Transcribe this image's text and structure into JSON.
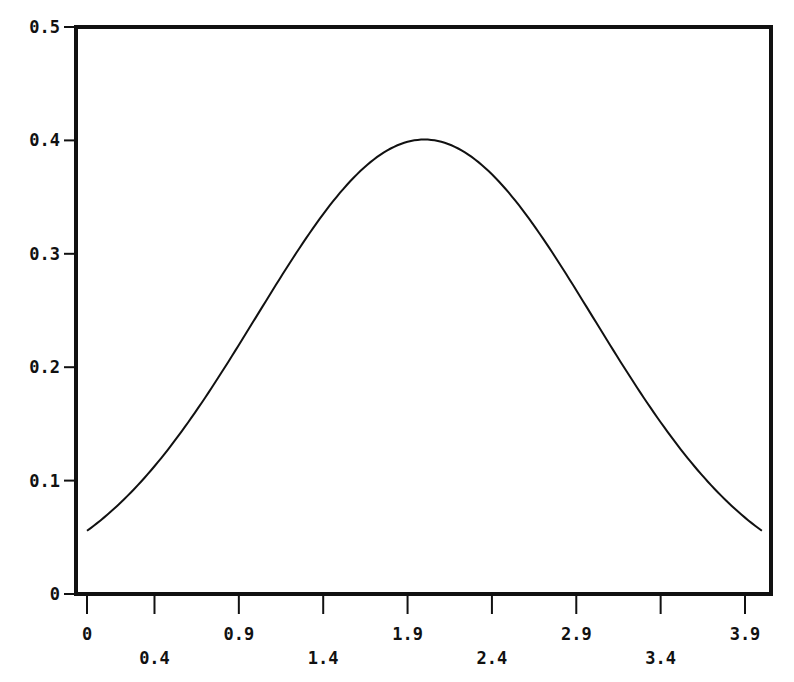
{
  "chart_data": {
    "type": "line",
    "title": "",
    "xlabel": "",
    "ylabel": "",
    "xlim": [
      -0.06,
      4.1
    ],
    "ylim": [
      0,
      0.5
    ],
    "grid": false,
    "legend": null,
    "x_ticks": [
      {
        "value": 0,
        "label": "0",
        "row": 0
      },
      {
        "value": 0.4,
        "label": "0.4",
        "row": 1
      },
      {
        "value": 0.9,
        "label": "0.9",
        "row": 0
      },
      {
        "value": 1.4,
        "label": "1.4",
        "row": 1
      },
      {
        "value": 1.9,
        "label": "1.9",
        "row": 0
      },
      {
        "value": 2.4,
        "label": "2.4",
        "row": 1
      },
      {
        "value": 2.9,
        "label": "2.9",
        "row": 0
      },
      {
        "value": 3.4,
        "label": "3.4",
        "row": 1
      },
      {
        "value": 3.9,
        "label": "3.9",
        "row": 0
      }
    ],
    "y_ticks": [
      {
        "value": 0,
        "label": "0"
      },
      {
        "value": 0.1,
        "label": "0.1"
      },
      {
        "value": 0.2,
        "label": "0.2"
      },
      {
        "value": 0.3,
        "label": "0.3"
      },
      {
        "value": 0.4,
        "label": "0.4"
      },
      {
        "value": 0.5,
        "label": "0.5"
      }
    ],
    "series": [
      {
        "name": "normal density (mean 2, sd 1)",
        "color": "#111111",
        "x": [
          0,
          0.2,
          0.4,
          0.6,
          0.8,
          1.0,
          1.2,
          1.4,
          1.6,
          1.8,
          2.0,
          2.2,
          2.4,
          2.6,
          2.8,
          3.0,
          3.2,
          3.4,
          3.6,
          3.8,
          4.0
        ],
        "y": [
          0.054,
          0.079,
          0.111,
          0.15,
          0.194,
          0.242,
          0.29,
          0.333,
          0.368,
          0.391,
          0.399,
          0.391,
          0.368,
          0.333,
          0.29,
          0.242,
          0.194,
          0.15,
          0.111,
          0.079,
          0.054
        ]
      }
    ]
  }
}
